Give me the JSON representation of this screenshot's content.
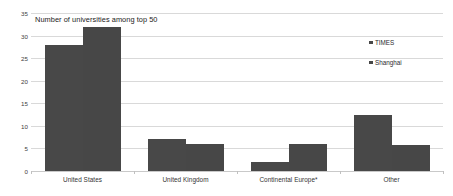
{
  "chart_data": {
    "type": "bar",
    "title": "Number of universities among top 50",
    "xlabel": "",
    "ylabel": "",
    "ylim": [
      0,
      35
    ],
    "yticks": [
      0,
      5,
      10,
      15,
      20,
      25,
      30,
      35
    ],
    "grid": true,
    "legend_position": "right",
    "categories": [
      "United States",
      "United Kingdom",
      "Continental Europe*",
      "Other"
    ],
    "series": [
      {
        "name": "TIMES",
        "color": "#484848",
        "values": [
          28,
          7,
          2,
          12.5
        ]
      },
      {
        "name": "Shanghai",
        "color": "#474747",
        "values": [
          32,
          6,
          6,
          5.7
        ]
      }
    ]
  },
  "legend": {
    "items": [
      {
        "label": "TIMES",
        "swatch": "legend-swatch-icon"
      },
      {
        "label": "Shanghai",
        "swatch": "legend-swatch-icon"
      }
    ]
  },
  "axes": {
    "y_tick_labels": [
      "35",
      "30",
      "25",
      "20",
      "15",
      "10",
      "5",
      "0"
    ],
    "x_tick_labels": [
      "United States",
      "United Kingdom",
      "Continental Europe*",
      "Other"
    ]
  },
  "colors": {
    "bar_primary": "#484848",
    "bar_secondary": "#474747",
    "gridline": "#d9d9d9",
    "axis": "#c9c9c9",
    "background": "#ffffff",
    "title_text": "#1a1a1a",
    "tick_text": "#404040"
  }
}
